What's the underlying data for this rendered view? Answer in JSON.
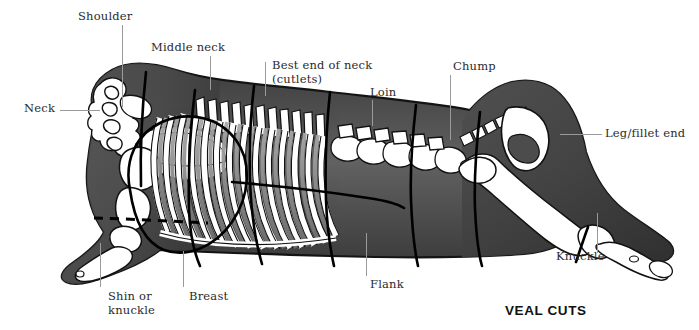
{
  "title": "VEAL CUTS",
  "title_pos": {
    "left": 505,
    "top": 303
  },
  "colors": {
    "background": "#ffffff",
    "meat_dark": "#4a4a4a",
    "meat_mid": "#5f5f5f",
    "meat_light": "#8b8b8b",
    "bone_white": "#ffffff",
    "bone_shade": "#9c9c9c",
    "outline": "#1a1a1a",
    "cut_line": "#000000",
    "leader_line": "#9a9a9a",
    "label_text": "#2b2b2b",
    "title_text": "#111111"
  },
  "labels": [
    {
      "id": "shoulder",
      "text": "Shoulder",
      "left": 78,
      "top": 10,
      "leader": {
        "type": "v",
        "left": 122,
        "top": 25,
        "length": 82
      }
    },
    {
      "id": "neck",
      "text": "Neck",
      "left": 24,
      "top": 102,
      "leader": {
        "type": "h",
        "left": 60,
        "top": 110,
        "length": 40
      }
    },
    {
      "id": "middle-neck",
      "text": "Middle neck",
      "left": 151,
      "top": 41,
      "leader": {
        "type": "v",
        "left": 210,
        "top": 56,
        "length": 34
      }
    },
    {
      "id": "best-end-of-neck",
      "text": "Best end of neck\n(cutlets)",
      "left": 272,
      "top": 59,
      "leader": {
        "type": "v",
        "left": 265,
        "top": 62,
        "length": 34
      }
    },
    {
      "id": "loin",
      "text": "Loin",
      "left": 370,
      "top": 86,
      "leader": {
        "type": "v",
        "left": 372,
        "top": 100,
        "length": 26
      }
    },
    {
      "id": "chump",
      "text": "Chump",
      "left": 453,
      "top": 60,
      "leader": {
        "type": "v",
        "left": 450,
        "top": 75,
        "length": 65
      }
    },
    {
      "id": "leg-fillet-end",
      "text": "Leg/fillet end",
      "left": 605,
      "top": 127,
      "leader": {
        "type": "h",
        "left": 560,
        "top": 134,
        "length": 42
      }
    },
    {
      "id": "knuckle",
      "text": "Knuckle",
      "left": 556,
      "top": 250,
      "leader": {
        "type": "v",
        "left": 597,
        "top": 213,
        "length": 40
      }
    },
    {
      "id": "flank",
      "text": "Flank",
      "left": 370,
      "top": 278,
      "leader": {
        "type": "v",
        "left": 366,
        "top": 233,
        "length": 43
      }
    },
    {
      "id": "breast",
      "text": "Breast",
      "left": 189,
      "top": 290,
      "leader": {
        "type": "v",
        "left": 183,
        "top": 251,
        "length": 36
      }
    },
    {
      "id": "shin-or-knuckle",
      "text": "Shin or\nknuckle",
      "left": 108,
      "top": 290,
      "leader": {
        "type": "v",
        "left": 100,
        "top": 243,
        "length": 44
      }
    }
  ],
  "diagram": {
    "name": "veal-carcass-side-view",
    "cut_lines": [
      {
        "id": "neck-shoulder-cut",
        "style": "solid"
      },
      {
        "id": "middle-neck-cut",
        "style": "solid"
      },
      {
        "id": "best-end-cut",
        "style": "solid"
      },
      {
        "id": "loin-cut",
        "style": "solid"
      },
      {
        "id": "chump-cut",
        "style": "solid"
      },
      {
        "id": "leg-cut",
        "style": "solid"
      },
      {
        "id": "knuckle-cut",
        "style": "solid"
      },
      {
        "id": "shoulder-circle-cut",
        "style": "solid"
      },
      {
        "id": "breast-flank-cut",
        "style": "solid"
      },
      {
        "id": "shin-cut",
        "style": "dashed"
      }
    ]
  }
}
